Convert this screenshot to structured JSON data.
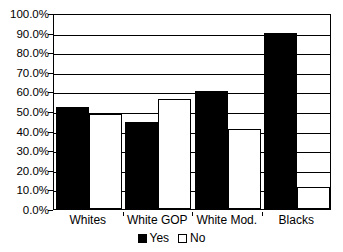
{
  "chart_data": {
    "type": "bar",
    "title": "",
    "subtitle": "",
    "xlabel": "",
    "ylabel": "",
    "categories": [
      "Whites",
      "White GOP",
      "White Mod.",
      "Blacks"
    ],
    "series": [
      {
        "name": "Yes",
        "color": "#000000",
        "values": [
          52.0,
          44.5,
          60.0,
          90.0
        ]
      },
      {
        "name": "No",
        "color": "#FFFFFF",
        "values": [
          48.5,
          56.0,
          41.0,
          11.0
        ]
      }
    ],
    "ylim": [
      0,
      100
    ],
    "ytick_step": 10,
    "ytick_labels": [
      "0.0%",
      "10.0%",
      "20.0%",
      "30.0%",
      "40.0%",
      "50.0%",
      "60.0%",
      "70.0%",
      "80.0%",
      "90.0%",
      "100.0%"
    ],
    "ytick_values": [
      0,
      10,
      20,
      30,
      40,
      50,
      60,
      70,
      80,
      90,
      100
    ],
    "grid": true,
    "grid_axis": "y",
    "legend_position": "bottom",
    "legend_entries": [
      "Yes",
      "No"
    ],
    "plot_border_color": "#000000",
    "background_color": "#FFFFFF"
  }
}
